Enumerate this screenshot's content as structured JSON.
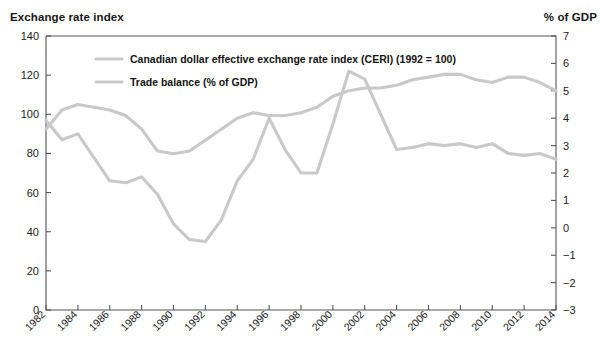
{
  "left_axis_title": "Exchange rate index",
  "right_axis_title": "% of GDP",
  "chart_data": {
    "type": "line",
    "title": "",
    "xlabel": "",
    "ylabel": "Exchange rate index",
    "y2label": "% of GDP",
    "grid": false,
    "legend_position": "top-center",
    "x": [
      1982,
      1983,
      1984,
      1985,
      1986,
      1987,
      1988,
      1989,
      1990,
      1991,
      1992,
      1993,
      1994,
      1995,
      1996,
      1997,
      1998,
      1999,
      2000,
      2001,
      2002,
      2003,
      2004,
      2005,
      2006,
      2007,
      2008,
      2009,
      2010,
      2011,
      2012,
      2013,
      2014
    ],
    "xticks": [
      "1982",
      "1984",
      "1986",
      "1988",
      "1990",
      "1992",
      "1994",
      "1996",
      "1998",
      "2000",
      "2002",
      "2004",
      "2006",
      "2008",
      "2010",
      "2012",
      "2014"
    ],
    "yticks": [
      0,
      20,
      40,
      60,
      80,
      100,
      120,
      140
    ],
    "ylim": [
      0,
      140
    ],
    "y2ticks": [
      -3,
      -2,
      -1,
      0,
      1,
      2,
      3,
      4,
      5,
      6,
      7
    ],
    "y2lim": [
      -3,
      7
    ],
    "series": [
      {
        "name": "Canadian dollar effective exchange rate index (CERI) (1992 = 100)",
        "axis": "right",
        "color": "#c9c9c9",
        "values": [
          3.6,
          4.3,
          4.5,
          4.4,
          4.3,
          4.1,
          3.6,
          2.8,
          2.7,
          2.8,
          3.2,
          3.6,
          4.0,
          4.2,
          4.1,
          4.1,
          4.2,
          4.4,
          4.8,
          5.0,
          5.1,
          5.1,
          5.2,
          5.4,
          5.5,
          5.6,
          5.6,
          5.4,
          5.3,
          5.5,
          5.5,
          5.3,
          5.0
        ]
      },
      {
        "name": "Trade balance (% of GDP)",
        "axis": "left",
        "color": "#c9c9c9",
        "values": [
          97,
          87,
          90,
          78,
          66,
          65,
          68,
          59,
          44,
          36,
          35,
          46,
          66,
          77,
          98,
          82,
          70,
          70,
          95,
          122,
          118,
          100,
          82,
          83,
          85,
          84,
          85,
          83,
          85,
          80,
          79,
          80,
          77
        ]
      }
    ],
    "legend": [
      {
        "label": "Canadian dollar effective exchange rate index (CERI) (1992 = 100)",
        "color": "#c9c9c9"
      },
      {
        "label": "Trade balance (% of GDP)",
        "color": "#c9c9c9"
      }
    ]
  }
}
